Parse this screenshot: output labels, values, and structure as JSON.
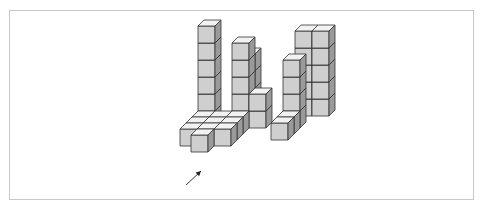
{
  "figure": {
    "colors": {
      "front": "#cfcfcf",
      "top": "#f2f2f2",
      "side": "#9a9a9a",
      "stroke": "#333333",
      "frame": "#c8c8c8",
      "arrow": "#222222"
    },
    "cube": {
      "size": 17,
      "depth_dx": 6,
      "depth_dy": -6
    },
    "origin": {
      "x": 180,
      "y": 129
    },
    "cubes": [
      {
        "col": 0,
        "depth": 3,
        "level": 0
      },
      {
        "col": 0,
        "depth": 3,
        "level": 1
      },
      {
        "col": 0,
        "depth": 3,
        "level": 2
      },
      {
        "col": 0,
        "depth": 3,
        "level": 3
      },
      {
        "col": 0,
        "depth": 3,
        "level": 4
      },
      {
        "col": 0,
        "depth": 3,
        "level": 5
      },
      {
        "col": 2,
        "depth": 4,
        "level": 0
      },
      {
        "col": 2,
        "depth": 4,
        "level": 1
      },
      {
        "col": 2,
        "depth": 4,
        "level": 2
      },
      {
        "col": 2,
        "depth": 4,
        "level": 3
      },
      {
        "col": 5,
        "depth": 5,
        "level": 0
      },
      {
        "col": 5,
        "depth": 5,
        "level": 1
      },
      {
        "col": 5,
        "depth": 5,
        "level": 2
      },
      {
        "col": 5,
        "depth": 5,
        "level": 3
      },
      {
        "col": 5,
        "depth": 5,
        "level": 4
      },
      {
        "col": 6,
        "depth": 5,
        "level": 0
      },
      {
        "col": 6,
        "depth": 5,
        "level": 1
      },
      {
        "col": 6,
        "depth": 5,
        "level": 2
      },
      {
        "col": 6,
        "depth": 5,
        "level": 3
      },
      {
        "col": 6,
        "depth": 5,
        "level": 4
      },
      {
        "col": 2,
        "depth": 3,
        "level": 0
      },
      {
        "col": 2,
        "depth": 3,
        "level": 1
      },
      {
        "col": 2,
        "depth": 3,
        "level": 2
      },
      {
        "col": 2,
        "depth": 3,
        "level": 3
      },
      {
        "col": 2,
        "depth": 3,
        "level": 4
      },
      {
        "col": 3,
        "depth": 3,
        "level": 0
      },
      {
        "col": 3,
        "depth": 3,
        "level": 1
      },
      {
        "col": 5,
        "depth": 3,
        "level": 0
      },
      {
        "col": 5,
        "depth": 3,
        "level": 1
      },
      {
        "col": 5,
        "depth": 3,
        "level": 2
      },
      {
        "col": 5,
        "depth": 3,
        "level": 3
      },
      {
        "col": 0,
        "depth": 2,
        "level": 0
      },
      {
        "col": 1,
        "depth": 2,
        "level": 0
      },
      {
        "col": 2,
        "depth": 2,
        "level": 0
      },
      {
        "col": 5,
        "depth": 2,
        "level": 0
      },
      {
        "col": 0,
        "depth": 1,
        "level": 0
      },
      {
        "col": 1,
        "depth": 1,
        "level": 0
      },
      {
        "col": 2,
        "depth": 1,
        "level": 0
      },
      {
        "col": 5,
        "depth": 1,
        "level": 0
      },
      {
        "col": 0,
        "depth": 0,
        "level": 0
      },
      {
        "col": 1,
        "depth": 0,
        "level": 0
      },
      {
        "col": 2,
        "depth": 0,
        "level": 0
      },
      {
        "col": 1,
        "depth": -1,
        "level": 0
      }
    ],
    "arrow": {
      "x1": 186,
      "y1": 185,
      "x2": 201,
      "y2": 171
    }
  }
}
